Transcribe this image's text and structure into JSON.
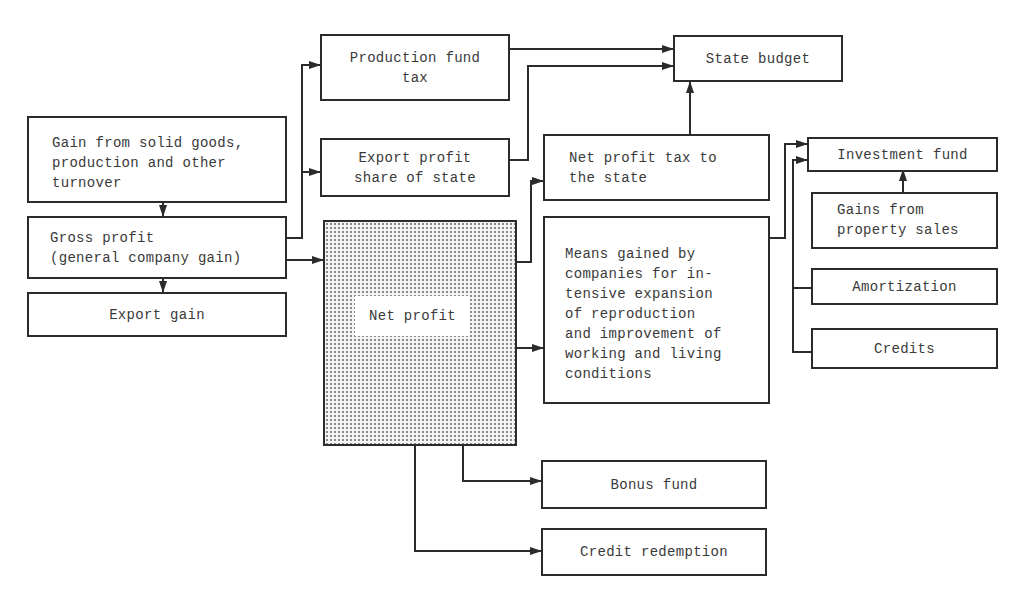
{
  "diagram": {
    "title": "",
    "nodes": {
      "gain_sources": {
        "label": "Gain from solid goods,\nproduction and other\nturnover"
      },
      "gross_profit": {
        "label": "Gross profit\n(general company gain)"
      },
      "export_gain": {
        "label": "Export gain"
      },
      "production_fund_tax": {
        "label": "Production fund\ntax"
      },
      "export_profit_share": {
        "label": "Export profit\nshare of state"
      },
      "net_profit": {
        "label": "Net profit"
      },
      "state_budget": {
        "label": "State budget"
      },
      "net_profit_tax": {
        "label": "Net profit tax to\nthe state"
      },
      "means_gained": {
        "label": "Means gained by\ncompanies for in-\ntensive expansion\nof reproduction\nand improvement of\nworking and living\nconditions"
      },
      "investment_fund": {
        "label": "Investment fund"
      },
      "property_sales": {
        "label": "Gains from\nproperty sales"
      },
      "amortization": {
        "label": "Amortization"
      },
      "credits": {
        "label": "Credits"
      },
      "bonus_fund": {
        "label": "Bonus fund"
      },
      "credit_redemption": {
        "label": "Credit redemption"
      }
    },
    "edges": [
      {
        "from": "Gain from solid goods, production and other turnover",
        "to": "Gross profit (general company gain)"
      },
      {
        "from": "Gross profit (general company gain)",
        "to": "Export gain"
      },
      {
        "from": "Gross profit (general company gain)",
        "to": "Production fund tax"
      },
      {
        "from": "Gross profit (general company gain)",
        "to": "Export profit share of state"
      },
      {
        "from": "Gross profit (general company gain)",
        "to": "Net profit"
      },
      {
        "from": "Production fund tax",
        "to": "State budget"
      },
      {
        "from": "Export profit share of state",
        "to": "State budget"
      },
      {
        "from": "Net profit tax to the state",
        "to": "State budget"
      },
      {
        "from": "Net profit",
        "to": "Net profit tax to the state"
      },
      {
        "from": "Net profit",
        "to": "Means gained by companies"
      },
      {
        "from": "Net profit",
        "to": "Bonus fund"
      },
      {
        "from": "Net profit",
        "to": "Credit redemption"
      },
      {
        "from": "Means gained by companies",
        "to": "Investment fund"
      },
      {
        "from": "Gains from property sales",
        "to": "Investment fund"
      },
      {
        "from": "Amortization",
        "to": "Investment fund"
      },
      {
        "from": "Credits",
        "to": "Investment fund"
      }
    ]
  }
}
